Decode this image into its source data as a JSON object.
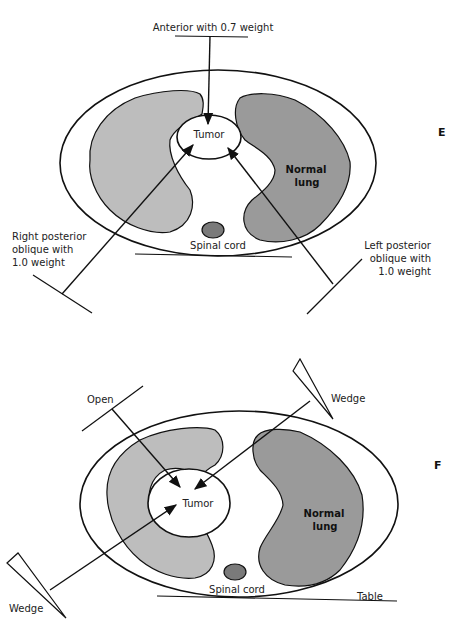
{
  "colors": {
    "stroke": "#111111",
    "right_lung": "#bdbdbd",
    "left_lung": "#9a9a9a",
    "spinal_cord": "#7a7a7a",
    "background": "#ffffff"
  },
  "panel_e": {
    "letter": "E",
    "beams": {
      "anterior": "Anterior with 0.7 weight",
      "right_posterior_oblique": [
        "Right posterior",
        "oblique with",
        "1.0 weight"
      ],
      "left_posterior_oblique": [
        "Left posterior",
        "oblique with",
        "1.0 weight"
      ]
    },
    "structures": {
      "tumor": "Tumor",
      "normal_lung": [
        "Normal",
        "lung"
      ],
      "spinal_cord": "Spinal cord"
    }
  },
  "panel_f": {
    "letter": "F",
    "beams": {
      "open": "Open",
      "wedge_upper": "Wedge",
      "wedge_lower": "Wedge"
    },
    "structures": {
      "tumor": "Tumor",
      "normal_lung": [
        "Normal",
        "lung"
      ],
      "spinal_cord": "Spinal cord",
      "table": "Table"
    }
  }
}
